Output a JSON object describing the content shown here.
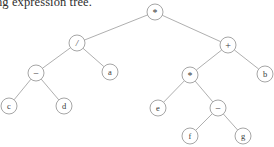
{
  "caption": {
    "text": "ng expression tree."
  },
  "figure": {
    "type": "binary-expression-tree",
    "background_color": "#ffffff",
    "edge_color": "#9a9a9a",
    "node_stroke_color": "#8e8e8e",
    "node_fill_color": "#ffffff",
    "label_color": "#3a3a3a",
    "node_radius": 8,
    "expression": "(c - d) / a * (e * (f - g) + b)",
    "nodes": [
      {
        "id": "n0",
        "label": "*",
        "kind": "operator",
        "glyph_class": "op-star",
        "x": 155,
        "y": 12,
        "r": 8
      },
      {
        "id": "n1",
        "label": "/",
        "kind": "operator",
        "glyph_class": "op-slash",
        "x": 77,
        "y": 43,
        "r": 8
      },
      {
        "id": "n2",
        "label": "+",
        "kind": "operator",
        "glyph_class": "op-plus",
        "x": 228,
        "y": 45,
        "r": 8
      },
      {
        "id": "n3",
        "label": "−",
        "kind": "operator",
        "glyph_class": "op-minus",
        "x": 36,
        "y": 73,
        "r": 8
      },
      {
        "id": "n4",
        "label": "a",
        "kind": "operand",
        "glyph_class": "leaf",
        "x": 110,
        "y": 72,
        "r": 8
      },
      {
        "id": "n5",
        "label": "*",
        "kind": "operator",
        "glyph_class": "op-star",
        "x": 190,
        "y": 75,
        "r": 8
      },
      {
        "id": "n6",
        "label": "b",
        "kind": "operand",
        "glyph_class": "leaf",
        "x": 265,
        "y": 74,
        "r": 8
      },
      {
        "id": "n7",
        "label": "c",
        "kind": "operand",
        "glyph_class": "leaf",
        "x": 9,
        "y": 106,
        "r": 8
      },
      {
        "id": "n8",
        "label": "d",
        "kind": "operand",
        "glyph_class": "leaf",
        "x": 64,
        "y": 106,
        "r": 8
      },
      {
        "id": "n9",
        "label": "e",
        "kind": "operand",
        "glyph_class": "leaf",
        "x": 158,
        "y": 108,
        "r": 8
      },
      {
        "id": "n10",
        "label": "−",
        "kind": "operator",
        "glyph_class": "op-minus",
        "x": 218,
        "y": 108,
        "r": 8
      },
      {
        "id": "n11",
        "label": "f",
        "kind": "operand",
        "glyph_class": "leaf",
        "x": 190,
        "y": 136,
        "r": 8
      },
      {
        "id": "n12",
        "label": "g",
        "kind": "operand",
        "glyph_class": "leaf",
        "x": 243,
        "y": 136,
        "r": 8
      }
    ],
    "edges": [
      {
        "from": "n0",
        "to": "n1"
      },
      {
        "from": "n0",
        "to": "n2"
      },
      {
        "from": "n1",
        "to": "n3"
      },
      {
        "from": "n1",
        "to": "n4"
      },
      {
        "from": "n2",
        "to": "n5"
      },
      {
        "from": "n2",
        "to": "n6"
      },
      {
        "from": "n3",
        "to": "n7"
      },
      {
        "from": "n3",
        "to": "n8"
      },
      {
        "from": "n5",
        "to": "n9"
      },
      {
        "from": "n5",
        "to": "n10"
      },
      {
        "from": "n10",
        "to": "n11"
      },
      {
        "from": "n10",
        "to": "n12"
      }
    ]
  }
}
